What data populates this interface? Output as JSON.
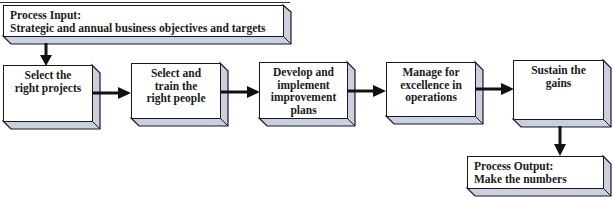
{
  "diagram": {
    "input": {
      "lines": [
        "Process Input:",
        "Strategic and annual business objectives and targets"
      ]
    },
    "steps": [
      {
        "lines": [
          "Select the",
          "right projects"
        ]
      },
      {
        "lines": [
          "Select and",
          "train the",
          "right people"
        ]
      },
      {
        "lines": [
          "Develop and",
          "implement",
          "improvement",
          "plans"
        ]
      },
      {
        "lines": [
          "Manage for",
          "excellence in",
          "operations"
        ]
      },
      {
        "lines": [
          "Sustain the",
          "gains"
        ]
      }
    ],
    "output": {
      "lines": [
        "Process Output:",
        "Make the numbers"
      ]
    },
    "colors": {
      "side_face": "#c9d0e0",
      "border": "#1a1a1a",
      "face": "#ffffff",
      "arrow": "#111111"
    }
  }
}
